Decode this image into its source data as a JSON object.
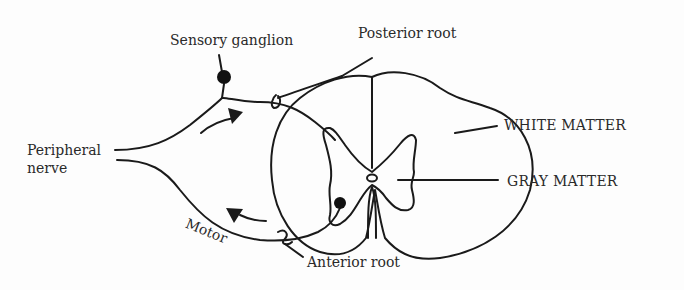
{
  "diagram": {
    "labels": {
      "sensory_ganglion": "Sensory ganglion",
      "posterior_root": "Posterior root",
      "white_matter": "WHITE MATTER",
      "gray_matter": "GRAY MATTER",
      "peripheral_nerve_line1": "Peripheral",
      "peripheral_nerve_line2": "nerve",
      "motor": "Motor",
      "anterior_root": "Anterior root"
    },
    "colors": {
      "stroke": "#1a1a1a",
      "text": "#2a2a2a",
      "background": "#fdfdfd"
    },
    "arrows": [
      {
        "name": "sensory-direction",
        "direction": "toward spinal cord"
      },
      {
        "name": "motor-direction",
        "direction": "away from spinal cord"
      }
    ]
  }
}
